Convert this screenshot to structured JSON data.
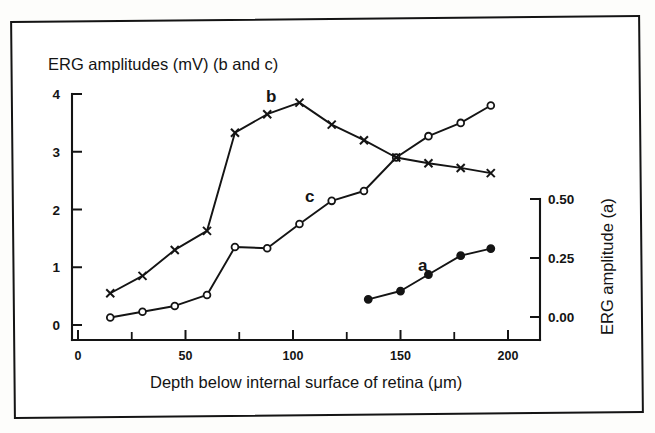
{
  "figure": {
    "top_axis_label": "ERG amplitudes (mV) (b and c)",
    "x_axis_label": "Depth below internal surface of retina (μm)",
    "right_axis_label": "ERG amplitude (a)"
  },
  "axes": {
    "left": {
      "ticks": [
        "0",
        "1",
        "2",
        "3",
        "4"
      ],
      "values": [
        0,
        1,
        2,
        3,
        4
      ],
      "min": 0,
      "max": 4,
      "unit": "mV"
    },
    "right": {
      "ticks": [
        "0.00",
        "0.25",
        "0.50"
      ],
      "values": [
        0.0,
        0.25,
        0.5
      ],
      "min": 0.0,
      "max": 0.5
    },
    "bottom": {
      "ticks": [
        "0",
        "50",
        "100",
        "150",
        "200"
      ],
      "values": [
        0,
        50,
        100,
        150,
        200
      ],
      "minor_values": [
        25,
        75,
        125,
        175
      ],
      "min": 0,
      "max": 200,
      "unit": "μm"
    }
  },
  "curve_labels": {
    "a": "a",
    "b": "b",
    "c": "c"
  },
  "colors": {
    "ink": "#141414",
    "paper": "#ffffff"
  },
  "chart_data": {
    "type": "line",
    "title": "",
    "xlabel": "Depth below internal surface of retina (μm)",
    "ylabel": "ERG amplitudes (mV) (b and c)",
    "y2label": "ERG amplitude (a)",
    "xlim": [
      0,
      200
    ],
    "ylim": [
      0,
      4
    ],
    "y2lim": [
      0.0,
      0.5
    ],
    "grid": false,
    "legend": "inline-annotations",
    "series": [
      {
        "name": "b",
        "label": "b",
        "axis": "left",
        "marker": "cross",
        "x": [
          15,
          30,
          45,
          60,
          73,
          88,
          103,
          118,
          133,
          148,
          163,
          178,
          192
        ],
        "values": [
          0.55,
          0.85,
          1.3,
          1.63,
          3.33,
          3.65,
          3.85,
          3.47,
          3.2,
          2.9,
          2.8,
          2.72,
          2.63
        ]
      },
      {
        "name": "c",
        "label": "c",
        "axis": "left",
        "marker": "open-circle",
        "x": [
          15,
          30,
          45,
          60,
          73,
          88,
          103,
          118,
          133,
          148,
          163,
          178,
          192
        ],
        "values": [
          0.13,
          0.23,
          0.33,
          0.52,
          1.35,
          1.33,
          1.75,
          2.15,
          2.32,
          2.9,
          3.27,
          3.5,
          3.8
        ]
      },
      {
        "name": "a",
        "label": "a",
        "axis": "right",
        "marker": "filled-circle",
        "x": [
          135,
          150,
          163,
          178,
          192
        ],
        "values": [
          0.075,
          0.11,
          0.18,
          0.26,
          0.29
        ]
      }
    ]
  }
}
